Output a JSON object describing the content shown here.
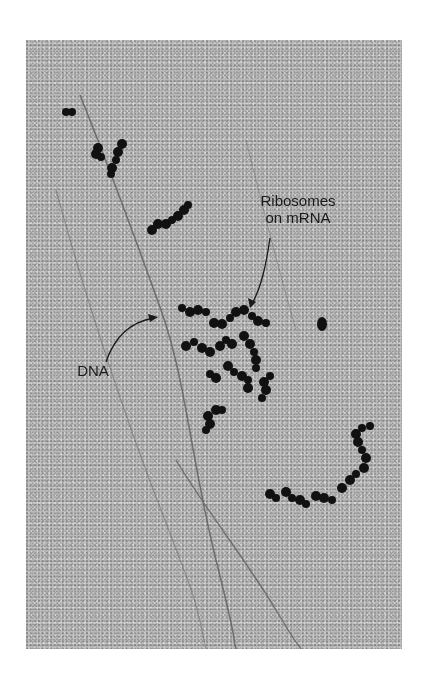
{
  "figure": {
    "labels": {
      "ribosomes_line1": "Ribosomes",
      "ribosomes_line2": "on mRNA",
      "dna": "DNA"
    },
    "colors": {
      "background": "#b9b9b9",
      "ribosome": "#111111",
      "dna_strand": "#5a5a5a",
      "label": "#1a1a1a"
    }
  }
}
